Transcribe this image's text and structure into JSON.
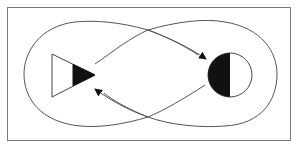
{
  "diagram": {
    "title": "",
    "frame": {
      "stroke": "#7a7a7a"
    },
    "colors": {
      "line": "#555555",
      "fill_dark": "#111111",
      "fill_light": "#ffffff"
    },
    "nodes": [
      {
        "id": "triangle",
        "shape": "triangle",
        "label": "",
        "half_filled": "right"
      },
      {
        "id": "circle",
        "shape": "circle",
        "label": "",
        "half_filled": "left"
      }
    ],
    "edges": [
      {
        "from": "triangle",
        "to": "circle",
        "style": "curved-arrow",
        "label": ""
      },
      {
        "from": "circle",
        "to": "triangle",
        "style": "curved-arrow",
        "label": ""
      }
    ],
    "loops": [
      {
        "name": "figure-eight-outer-loop",
        "label": ""
      }
    ]
  }
}
